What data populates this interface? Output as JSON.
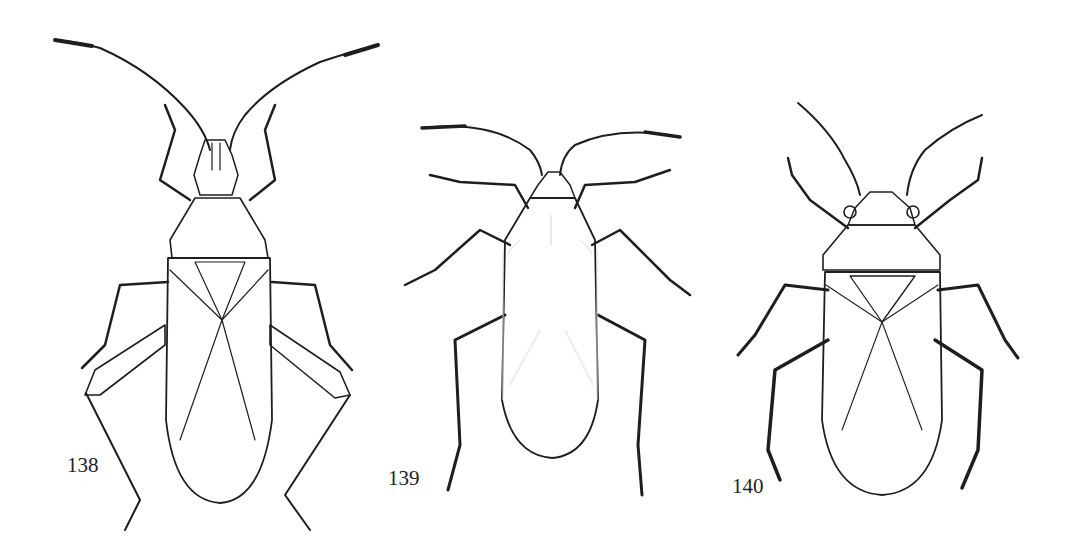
{
  "plate": {
    "background": "#ffffff",
    "ink_color": "#1e1e1e",
    "figures": [
      {
        "id": "138",
        "label": "138",
        "style": "stippled-light",
        "description": "slender bug with long antennae and spined hind femora"
      },
      {
        "id": "139",
        "label": "139",
        "style": "dark",
        "description": "dark elongate bug with pale wing veins"
      },
      {
        "id": "140",
        "label": "140",
        "style": "hairy-light",
        "description": "hairy bug with triangular pronotum"
      }
    ]
  }
}
